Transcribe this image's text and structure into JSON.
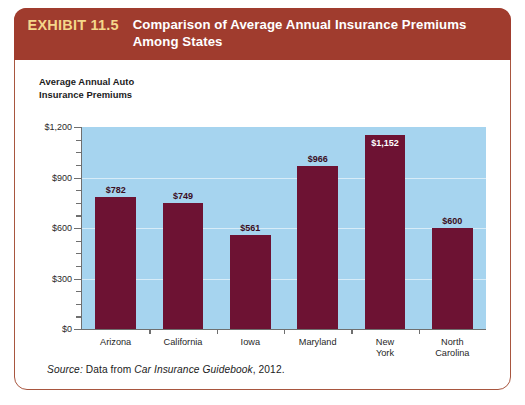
{
  "exhibit": {
    "number": "EXHIBIT 11.5",
    "title": "Comparison of Average Annual Insurance Premiums Among States",
    "header_bg": "#a03c2e",
    "number_color": "#f4d78a"
  },
  "axis_title_line1": "Average Annual Auto",
  "axis_title_line2": "Insurance Premiums",
  "source": {
    "prefix": "Source:",
    "text_before": " Data from ",
    "italic_work": "Car Insurance Guidebook",
    "text_after": ", 2012."
  },
  "chart_data": {
    "type": "bar",
    "title": "Comparison of Average Annual Insurance Premiums Among States",
    "xlabel": "",
    "ylabel": "Average Annual Auto Insurance Premiums",
    "categories": [
      "Arizona",
      "California",
      "Iowa",
      "Maryland",
      "New York",
      "North Carolina"
    ],
    "category_labels": [
      "Arizona",
      "California",
      "Iowa",
      "Maryland",
      "New\nYork",
      "North\nCarolina"
    ],
    "values": [
      782,
      749,
      561,
      966,
      1152,
      600
    ],
    "value_labels": [
      "$782",
      "$749",
      "$561",
      "$966",
      "$1,152",
      "$600"
    ],
    "ylim": [
      0,
      1200
    ],
    "ytick_values": [
      0,
      300,
      600,
      900,
      1200
    ],
    "ytick_labels": [
      "$0",
      "$300",
      "$600",
      "$900",
      "$1,200"
    ],
    "yminor_step": 75,
    "grid": true,
    "legend": "none",
    "plot_bg": "#a6d4ef",
    "bar_color": "#6d1233",
    "value_label_color": "#3a0d22",
    "inside_label_color": "#ffffff"
  }
}
